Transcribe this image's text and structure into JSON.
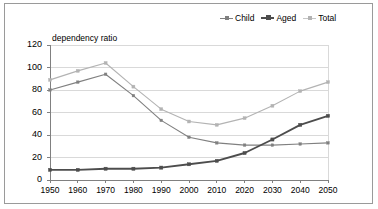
{
  "chart_data": {
    "type": "line",
    "title": "",
    "ylabel": "dependency ratio",
    "xlabel": "",
    "categories": [
      "1950",
      "1960",
      "1970",
      "1980",
      "1990",
      "2000",
      "2010",
      "2020",
      "2030",
      "2040",
      "2050"
    ],
    "x": [
      1950,
      1960,
      1970,
      1980,
      1990,
      2000,
      2010,
      2020,
      2030,
      2040,
      2050
    ],
    "ylim": [
      0,
      120
    ],
    "yticks": [
      0,
      20,
      40,
      60,
      80,
      100,
      120
    ],
    "ytick_labels": [
      "0",
      "20",
      "40",
      "60",
      "80",
      "100",
      "120"
    ],
    "grid": true,
    "grid_axis": "y",
    "legend_position": "top-right",
    "series": [
      {
        "name": "Child",
        "color": "#808080",
        "marker": "square",
        "values": [
          80,
          87,
          94,
          75,
          53,
          38,
          33,
          31,
          31,
          32,
          33
        ]
      },
      {
        "name": "Aged",
        "color": "#4d4d4d",
        "marker": "square",
        "values": [
          9,
          9,
          10,
          10,
          11,
          14,
          17,
          24,
          36,
          49,
          57
        ]
      },
      {
        "name": "Total",
        "color": "#b3b3b3",
        "marker": "square",
        "values": [
          89,
          97,
          104,
          83,
          63,
          52,
          49,
          55,
          66,
          79,
          87
        ]
      }
    ]
  },
  "legend": {
    "items": [
      {
        "label": "Child"
      },
      {
        "label": "Aged"
      },
      {
        "label": "Total"
      }
    ]
  },
  "axes": {
    "y_title": "dependency ratio"
  },
  "colors": {
    "frame": "#9a9a9a",
    "grid": "#d9d9d9",
    "axis": "#808080",
    "child": "#808080",
    "aged": "#4d4d4d",
    "total": "#b3b3b3"
  }
}
